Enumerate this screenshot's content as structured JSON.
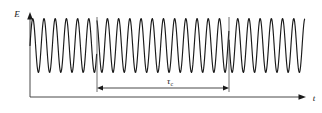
{
  "figure": {
    "name": "coherence-time-wavetrain",
    "background_color": "#ffffff",
    "line_color": "#1a1a1a",
    "axes": {
      "y_label": "E",
      "x_label": "t",
      "origin": {
        "x": 30,
        "y": 97
      },
      "y_top": {
        "x": 30,
        "y": 14
      },
      "x_right": {
        "x": 305,
        "y": 97
      }
    },
    "annotations": {
      "interval_label": "τ",
      "interval_subscript": "c",
      "interval_label_full": "τc",
      "interval_label_x": 172,
      "interval_label_y": 83
    },
    "markers": {
      "left_marker_x": 97,
      "right_marker_x": 229,
      "marker_top_y": 17,
      "marker_bottom_y": 92
    },
    "measure_arrow": {
      "y": 88,
      "x_start": 97,
      "x_end": 229
    }
  },
  "chart_data": {
    "type": "line",
    "title": "",
    "xlabel": "t",
    "ylabel": "E",
    "grid": false,
    "legend": null,
    "x_range": [
      30,
      305
    ],
    "y_range": [
      18,
      73
    ],
    "baseline_y": 45.5,
    "amplitude": 27,
    "period_px": 11.2,
    "phase_jumps_at_x": [
      97,
      229
    ],
    "phase_offsets_rad": [
      0.0,
      2.1,
      4.4
    ],
    "annotation_interval": {
      "from_x": 97,
      "to_x": 229,
      "label": "τc"
    }
  }
}
